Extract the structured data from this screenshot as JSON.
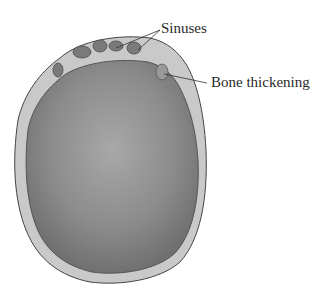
{
  "diagram": {
    "labels": {
      "sinuses": "Sinuses",
      "bone_thickening": "Bone thickening"
    },
    "colors": {
      "skull_fill": "#8e8e8e",
      "skull_rim": "#c9c9c9",
      "outline": "#444444",
      "background": "#ffffff"
    }
  }
}
